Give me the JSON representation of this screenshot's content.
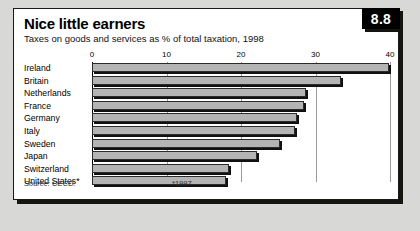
{
  "badge": {
    "number": "8.8"
  },
  "header": {
    "title": "Nice little earners",
    "subtitle": "Taxes on goods and services as % of total taxation, 1998"
  },
  "footer": {
    "source": "Source: OECD.",
    "asterisk_note": "*1997"
  },
  "chart_data": {
    "type": "bar",
    "orientation": "horizontal",
    "title": "Nice little earners",
    "subtitle": "Taxes on goods and services as % of total taxation, 1998",
    "xlabel": "",
    "ylabel": "",
    "xlim": [
      0,
      40
    ],
    "xticks": [
      0,
      10,
      20,
      30,
      40
    ],
    "xtick_labels": [
      "0",
      "10",
      "20",
      "30",
      "40"
    ],
    "grid": true,
    "legend": "none",
    "categories": [
      "Ireland",
      "Britain",
      "Netherlands",
      "France",
      "Germany",
      "Italy",
      "Sweden",
      "Japan",
      "Switzerland",
      "United States*"
    ],
    "values": [
      39.8,
      33.4,
      28.7,
      28.5,
      27.5,
      27.2,
      25.2,
      22.1,
      18.4,
      18.0
    ],
    "bar_color": "#b4b4b4",
    "bar_border_color": "#2b2b2b",
    "footnote": "*1997",
    "source": "Source: OECD."
  }
}
